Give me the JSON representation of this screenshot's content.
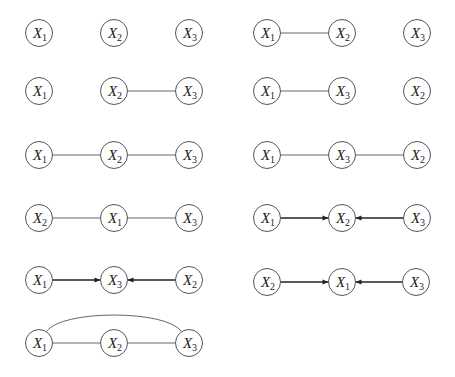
{
  "diagram": {
    "node_radius": 13.5,
    "colors": {
      "node_stroke": "#555555",
      "edge": "#666666",
      "arrow": "#222222",
      "text": "#222222",
      "background": "#ffffff"
    },
    "graphs": [
      {
        "id": "g1",
        "nodes": [
          {
            "var": "X",
            "sub": "1",
            "x": 39,
            "y": 33
          },
          {
            "var": "X",
            "sub": "2",
            "x": 114,
            "y": 33
          },
          {
            "var": "X",
            "sub": "3",
            "x": 189,
            "y": 33
          }
        ],
        "edges": []
      },
      {
        "id": "g2",
        "nodes": [
          {
            "var": "X",
            "sub": "1",
            "x": 267,
            "y": 33
          },
          {
            "var": "X",
            "sub": "2",
            "x": 342,
            "y": 33
          },
          {
            "var": "X",
            "sub": "3",
            "x": 417,
            "y": 33
          }
        ],
        "edges": [
          {
            "from": 0,
            "to": 1,
            "type": "undirected"
          }
        ]
      },
      {
        "id": "g3",
        "nodes": [
          {
            "var": "X",
            "sub": "1",
            "x": 39,
            "y": 91
          },
          {
            "var": "X",
            "sub": "2",
            "x": 114,
            "y": 91
          },
          {
            "var": "X",
            "sub": "3",
            "x": 189,
            "y": 91
          }
        ],
        "edges": [
          {
            "from": 1,
            "to": 2,
            "type": "undirected"
          }
        ]
      },
      {
        "id": "g4",
        "nodes": [
          {
            "var": "X",
            "sub": "1",
            "x": 267,
            "y": 91
          },
          {
            "var": "X",
            "sub": "3",
            "x": 342,
            "y": 91
          },
          {
            "var": "X",
            "sub": "2",
            "x": 417,
            "y": 91
          }
        ],
        "edges": [
          {
            "from": 0,
            "to": 1,
            "type": "undirected"
          }
        ]
      },
      {
        "id": "g5",
        "nodes": [
          {
            "var": "X",
            "sub": "1",
            "x": 39,
            "y": 155
          },
          {
            "var": "X",
            "sub": "2",
            "x": 114,
            "y": 155
          },
          {
            "var": "X",
            "sub": "3",
            "x": 189,
            "y": 155
          }
        ],
        "edges": [
          {
            "from": 0,
            "to": 1,
            "type": "undirected"
          },
          {
            "from": 1,
            "to": 2,
            "type": "undirected"
          }
        ]
      },
      {
        "id": "g6",
        "nodes": [
          {
            "var": "X",
            "sub": "1",
            "x": 267,
            "y": 155
          },
          {
            "var": "X",
            "sub": "3",
            "x": 342,
            "y": 155
          },
          {
            "var": "X",
            "sub": "2",
            "x": 417,
            "y": 155
          }
        ],
        "edges": [
          {
            "from": 0,
            "to": 1,
            "type": "undirected"
          },
          {
            "from": 1,
            "to": 2,
            "type": "undirected"
          }
        ]
      },
      {
        "id": "g7",
        "nodes": [
          {
            "var": "X",
            "sub": "2",
            "x": 39,
            "y": 218
          },
          {
            "var": "X",
            "sub": "1",
            "x": 114,
            "y": 218
          },
          {
            "var": "X",
            "sub": "3",
            "x": 189,
            "y": 218
          }
        ],
        "edges": [
          {
            "from": 0,
            "to": 1,
            "type": "undirected"
          },
          {
            "from": 1,
            "to": 2,
            "type": "undirected"
          }
        ]
      },
      {
        "id": "g8",
        "nodes": [
          {
            "var": "X",
            "sub": "1",
            "x": 267,
            "y": 218
          },
          {
            "var": "X",
            "sub": "2",
            "x": 342,
            "y": 218
          },
          {
            "var": "X",
            "sub": "3",
            "x": 417,
            "y": 218
          }
        ],
        "edges": [
          {
            "from": 0,
            "to": 1,
            "type": "directed"
          },
          {
            "from": 2,
            "to": 1,
            "type": "directed"
          }
        ]
      },
      {
        "id": "g9",
        "nodes": [
          {
            "var": "X",
            "sub": "1",
            "x": 39,
            "y": 280
          },
          {
            "var": "X",
            "sub": "3",
            "x": 114,
            "y": 280
          },
          {
            "var": "X",
            "sub": "2",
            "x": 189,
            "y": 280
          }
        ],
        "edges": [
          {
            "from": 0,
            "to": 1,
            "type": "directed"
          },
          {
            "from": 2,
            "to": 1,
            "type": "directed"
          }
        ]
      },
      {
        "id": "g10",
        "nodes": [
          {
            "var": "X",
            "sub": "2",
            "x": 267,
            "y": 282
          },
          {
            "var": "X",
            "sub": "1",
            "x": 342,
            "y": 282
          },
          {
            "var": "X",
            "sub": "3",
            "x": 416,
            "y": 282
          }
        ],
        "edges": [
          {
            "from": 0,
            "to": 1,
            "type": "directed"
          },
          {
            "from": 2,
            "to": 1,
            "type": "directed"
          }
        ]
      },
      {
        "id": "g11",
        "nodes": [
          {
            "var": "X",
            "sub": "1",
            "x": 39,
            "y": 343
          },
          {
            "var": "X",
            "sub": "2",
            "x": 114,
            "y": 343
          },
          {
            "var": "X",
            "sub": "3",
            "x": 189,
            "y": 343
          }
        ],
        "edges": [
          {
            "from": 0,
            "to": 1,
            "type": "undirected"
          },
          {
            "from": 1,
            "to": 2,
            "type": "undirected"
          },
          {
            "from": 0,
            "to": 2,
            "type": "undirected-arc"
          }
        ]
      }
    ]
  }
}
